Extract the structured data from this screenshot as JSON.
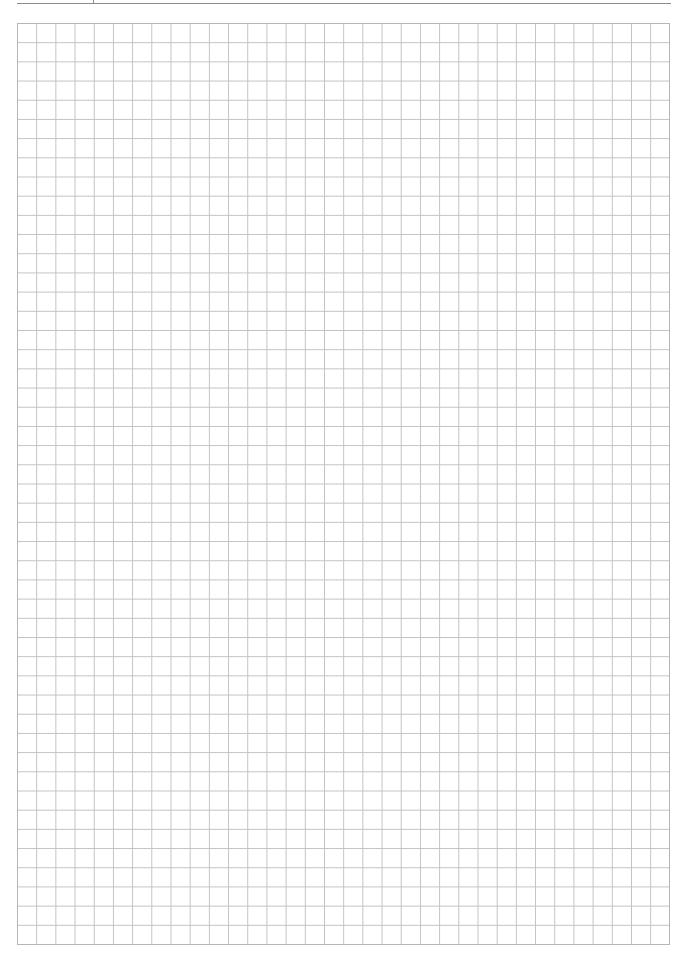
{
  "page": {
    "type": "graph-paper",
    "background_color": "#ffffff",
    "header": {
      "rule_color": "#8c8c8c",
      "has_tick_mark": true
    },
    "grid": {
      "columns": 34,
      "rows": 48,
      "cell_size_px": 19.2,
      "line_color": "#c2c2c2",
      "border_color": "#b5b5b5"
    }
  }
}
